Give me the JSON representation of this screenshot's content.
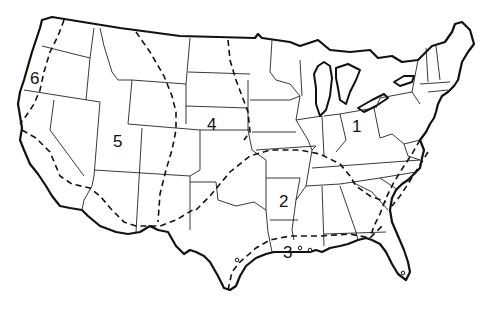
{
  "map": {
    "type": "outline map of the contiguous United States",
    "style": "black line art on white",
    "colors": {
      "line": "#111111",
      "background": "#ffffff"
    },
    "region_labels": [
      {
        "id": "1",
        "text": "1",
        "x": 352,
        "y": 118
      },
      {
        "id": "2",
        "text": "2",
        "x": 279,
        "y": 193
      },
      {
        "id": "3",
        "text": "3",
        "x": 283,
        "y": 245
      },
      {
        "id": "4",
        "text": "4",
        "x": 209,
        "y": 116
      },
      {
        "id": "5",
        "text": "5",
        "x": 113,
        "y": 131
      },
      {
        "id": "6",
        "text": "6",
        "x": 30,
        "y": 68
      }
    ],
    "legend": {
      "dashed_line": "region boundary",
      "solid_thin": "state boundary",
      "solid_thick": "national coastline / border"
    }
  }
}
